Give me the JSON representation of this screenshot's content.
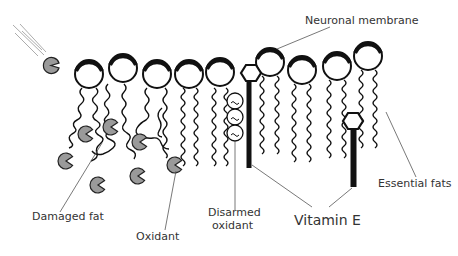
{
  "labels": {
    "neuronal_membrane": "Neuronal membrane",
    "essential_fats": "Essential fats",
    "damaged_fat": "Damaged fat",
    "oxidant": "Oxidant",
    "disarmed_oxidant_line1": "Disarmed",
    "disarmed_oxidant_line2": "oxidant",
    "vitamin_e": "Vitamin E"
  },
  "components": {
    "phospholipid_count": 10,
    "damaged_phospholipid_count": 3,
    "free_oxidant_count": 7,
    "disarmed_oxidant_count": 3,
    "vitamin_e_count": 2
  },
  "colors": {
    "oxidant_fill": "#9a9a9a",
    "outline": "#111111",
    "label_text": "#333333"
  }
}
